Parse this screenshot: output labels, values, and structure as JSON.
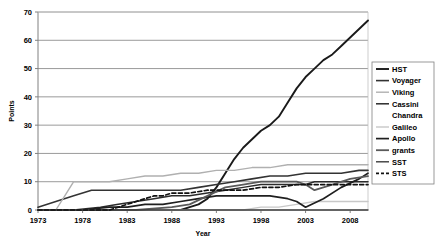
{
  "chart_data": {
    "type": "line",
    "title": "",
    "xlabel": "Year",
    "ylabel": "Points",
    "xlim": [
      1973,
      2010
    ],
    "ylim": [
      0,
      70
    ],
    "xticks": [
      1973,
      1978,
      1983,
      1988,
      1993,
      1998,
      2003,
      2008
    ],
    "yticks": [
      0,
      10,
      20,
      30,
      40,
      50,
      60,
      70
    ],
    "grid": "horizontal",
    "legend_position": "right",
    "series": [
      {
        "name": "HST",
        "color": "#1a1a1a",
        "width": 1.9,
        "dash": "none",
        "x": [
          1973,
          1975,
          1977,
          1979,
          1981,
          1983,
          1985,
          1987,
          1989,
          1990,
          1991,
          1992,
          1993,
          1994,
          1995,
          1996,
          1997,
          1998,
          1999,
          2000,
          2001,
          2002,
          2003,
          2004,
          2005,
          2006,
          2007,
          2008,
          2009,
          2010
        ],
        "values": [
          0,
          0,
          0,
          0,
          0,
          0,
          0,
          0,
          0,
          1,
          2,
          4,
          8,
          13,
          18,
          22,
          25,
          28,
          30,
          33,
          38,
          43,
          47,
          50,
          53,
          55,
          58,
          61,
          64,
          67
        ]
      },
      {
        "name": "Voyager",
        "color": "#333333",
        "width": 1.6,
        "dash": "none",
        "x": [
          1973,
          1975,
          1977,
          1979,
          1981,
          1983,
          1985,
          1987,
          1989,
          1991,
          1993,
          1995,
          1997,
          1999,
          2001,
          2003,
          2005,
          2007,
          2009,
          2010
        ],
        "values": [
          1,
          3,
          5,
          7,
          7,
          7,
          7,
          7,
          7,
          8,
          9,
          10,
          11,
          12,
          12,
          13,
          13,
          13,
          14,
          14
        ]
      },
      {
        "name": "Viking",
        "color": "#b0b0b0",
        "width": 1.4,
        "dash": "none",
        "x": [
          1973,
          1974,
          1975,
          1976,
          1977,
          1979,
          1981,
          1983,
          1985,
          1987,
          1989,
          1991,
          1993,
          1995,
          1997,
          1999,
          2001,
          2003,
          2005,
          2007,
          2009,
          2010
        ],
        "values": [
          0,
          0,
          0,
          5,
          10,
          10,
          10,
          11,
          12,
          12,
          13,
          13,
          14,
          14,
          15,
          15,
          16,
          16,
          16,
          16,
          16,
          16
        ]
      },
      {
        "name": "Cassini",
        "color": "#2b2b2b",
        "width": 1.5,
        "dash": "none",
        "x": [
          1973,
          1977,
          1980,
          1982,
          1984,
          1986,
          1988,
          1990,
          1992,
          1994,
          1996,
          1998,
          2000,
          2002,
          2003,
          2004,
          2006,
          2008,
          2010
        ],
        "values": [
          0,
          0,
          1,
          2,
          3,
          4,
          5,
          5,
          6,
          7,
          8,
          9,
          9,
          9,
          9,
          10,
          10,
          10,
          10
        ]
      },
      {
        "name": "Chandra",
        "color": "#ffffff",
        "width": 1.2,
        "dash": "none",
        "x": [
          1973,
          1985,
          1995,
          2000,
          2005,
          2010
        ],
        "values": [
          0,
          0,
          0,
          0,
          0,
          0
        ]
      },
      {
        "name": "Galileo",
        "color": "#c8c8c8",
        "width": 1.4,
        "dash": "none",
        "x": [
          1973,
          1985,
          1990,
          1994,
          1996,
          1998,
          2000,
          2002,
          2004,
          2006,
          2008,
          2010
        ],
        "values": [
          0,
          0,
          0,
          0,
          0,
          1,
          1,
          2,
          3,
          3,
          3,
          3
        ]
      },
      {
        "name": "Apollo",
        "color": "#1f1f1f",
        "width": 1.7,
        "dash": "none",
        "x": [
          1973,
          1978,
          1981,
          1983,
          1985,
          1987,
          1989,
          1991,
          1993,
          1995,
          1997,
          1999,
          2001,
          2002,
          2003,
          2005,
          2007,
          2009,
          2010
        ],
        "values": [
          0,
          0,
          1,
          1,
          2,
          2,
          3,
          4,
          5,
          5,
          5,
          5,
          4,
          3,
          1,
          4,
          8,
          11,
          13
        ]
      },
      {
        "name": "grants",
        "color": "#5a5a5a",
        "width": 1.8,
        "dash": "none",
        "x": [
          1973,
          1980,
          1984,
          1988,
          1990,
          1992,
          1994,
          1996,
          1998,
          2000,
          2002,
          2003,
          2004,
          2006,
          2008,
          2010
        ],
        "values": [
          0,
          0,
          0,
          1,
          2,
          5,
          8,
          9,
          10,
          10,
          10,
          9,
          7,
          9,
          11,
          12
        ]
      },
      {
        "name": "SST",
        "color": "#3d3d3d",
        "width": 1.4,
        "dash": "none",
        "x": [
          1973,
          1982,
          1988,
          1992,
          1996,
          2000,
          2003,
          2006,
          2008,
          2010
        ],
        "values": [
          0,
          0,
          0,
          0,
          0,
          0,
          0,
          0,
          0,
          0
        ]
      },
      {
        "name": "STS",
        "color": "#111111",
        "width": 1.7,
        "dash": "dashed",
        "x": [
          1973,
          1981,
          1982,
          1983,
          1984,
          1985,
          1986,
          1987,
          1988,
          1989,
          1990,
          1992,
          1994,
          1996,
          1998,
          2000,
          2002,
          2004,
          2006,
          2008,
          2010
        ],
        "values": [
          0,
          0,
          1,
          2,
          3,
          4,
          5,
          5,
          6,
          6,
          6,
          7,
          7,
          7,
          8,
          8,
          9,
          9,
          9,
          9,
          9
        ]
      }
    ]
  }
}
